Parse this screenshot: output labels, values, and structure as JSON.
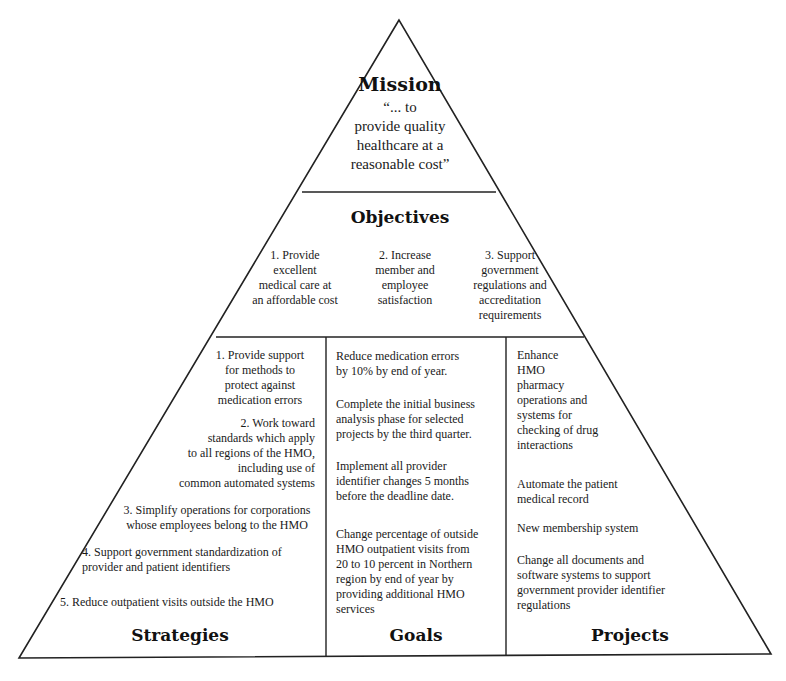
{
  "diagram": {
    "type": "pyramid",
    "mission": {
      "title": "Mission",
      "quote": "“... to\nprovide quality\nhealthcare at a\nreasonable cost”"
    },
    "objectives": {
      "title": "Objectives",
      "items": [
        "1. Provide\nexcellent\nmedical care at\nan affordable cost",
        "2. Increase\nmember and\nemployee\nsatisfaction",
        "3. Support\ngovernment\nregulations and\naccreditation\nrequirements"
      ]
    },
    "strategies": {
      "title": "Strategies",
      "items": [
        "1. Provide support\nfor methods to\nprotect against\nmedication errors",
        "2. Work toward\nstandards which apply\nto all regions of the HMO,\nincluding use of\ncommon automated systems",
        "3. Simplify operations for corporations\nwhose employees belong to the HMO",
        "4. Support government standardization of\nprovider and patient identifiers",
        "5. Reduce outpatient visits outside the HMO"
      ]
    },
    "goals": {
      "title": "Goals",
      "items": [
        "Reduce medication errors\nby 10% by end of year.",
        "Complete the initial business\nanalysis phase for selected\nprojects by the third quarter.",
        "Implement all provider\nidentifier changes 5 months\nbefore the deadline date.",
        "Change percentage of outside\nHMO outpatient visits from\n20 to 10 percent in Northern\nregion by end of year by\nproviding additional HMO\nservices"
      ]
    },
    "projects": {
      "title": "Projects",
      "items": [
        "Enhance\nHMO\n pharmacy\noperations and\nsystems for\nchecking of drug\ninteractions",
        "Automate the patient\nmedical record",
        "New membership system",
        "Change all documents and\nsoftware systems to support\ngovernment provider identifier\nregulations"
      ]
    },
    "colors": {
      "line": "#222222",
      "background": "#ffffff",
      "text": "#111111"
    }
  }
}
